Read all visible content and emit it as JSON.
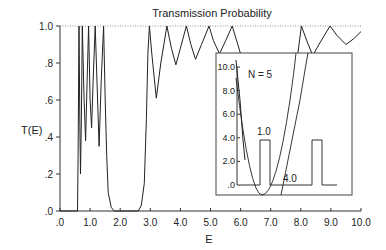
{
  "chart_data": [
    {
      "type": "line",
      "title": "Transmission Probability",
      "xlabel": "E",
      "ylabel": "T(E)",
      "xlim": [
        0,
        10
      ],
      "ylim": [
        0,
        1.0
      ],
      "x_ticks": [
        ".0",
        "1.0",
        "2.0",
        "3.0",
        "4.0",
        "5.0",
        "6.0",
        "7.0",
        "8.0",
        "9.0",
        "10.0"
      ],
      "y_ticks": [
        ".0",
        ".2",
        ".4",
        ".6",
        ".8",
        "1.0"
      ],
      "reference_line": {
        "y": 1.0,
        "style": "dotted"
      },
      "grid": false,
      "series": [
        {
          "name": "T(E)",
          "points": [
            [
              0.0,
              0.0
            ],
            [
              0.58,
              0.0
            ],
            [
              0.6,
              0.3
            ],
            [
              0.63,
              1.0
            ],
            [
              0.66,
              0.45
            ],
            [
              0.68,
              0.2
            ],
            [
              0.71,
              0.5
            ],
            [
              0.74,
              1.0
            ],
            [
              0.8,
              0.6
            ],
            [
              0.85,
              0.38
            ],
            [
              0.9,
              0.7
            ],
            [
              0.95,
              1.0
            ],
            [
              1.0,
              0.6
            ],
            [
              1.05,
              0.45
            ],
            [
              1.1,
              0.7
            ],
            [
              1.17,
              1.0
            ],
            [
              1.25,
              0.6
            ],
            [
              1.3,
              0.35
            ],
            [
              1.37,
              0.7
            ],
            [
              1.45,
              1.0
            ],
            [
              1.5,
              0.6
            ],
            [
              1.55,
              0.3
            ],
            [
              1.6,
              0.1
            ],
            [
              1.7,
              0.02
            ],
            [
              1.8,
              0.0
            ],
            [
              2.6,
              0.0
            ],
            [
              2.7,
              0.03
            ],
            [
              2.8,
              0.15
            ],
            [
              2.87,
              0.5
            ],
            [
              2.92,
              0.85
            ],
            [
              2.97,
              1.0
            ],
            [
              3.05,
              0.85
            ],
            [
              3.2,
              0.61
            ],
            [
              3.35,
              0.8
            ],
            [
              3.55,
              1.0
            ],
            [
              3.7,
              0.88
            ],
            [
              3.85,
              0.79
            ],
            [
              4.0,
              0.88
            ],
            [
              4.2,
              1.0
            ],
            [
              4.35,
              0.9
            ],
            [
              4.5,
              0.82
            ],
            [
              4.7,
              0.9
            ],
            [
              4.95,
              1.0
            ],
            [
              5.1,
              0.92
            ],
            [
              5.3,
              0.85
            ],
            [
              5.5,
              0.92
            ],
            [
              5.72,
              1.0
            ],
            [
              5.85,
              0.93
            ],
            [
              6.0,
              0.85
            ],
            [
              7.9,
              0.85
            ],
            [
              8.02,
              1.0
            ],
            [
              8.2,
              0.92
            ],
            [
              8.4,
              0.84
            ],
            [
              8.6,
              0.9
            ],
            [
              8.97,
              1.0
            ],
            [
              9.2,
              0.95
            ],
            [
              9.5,
              0.9
            ],
            [
              9.75,
              0.93
            ],
            [
              10.0,
              0.97
            ]
          ]
        }
      ],
      "notes": "Transmission resonances below barrier height; zero gap approx 1.8 < E < 2.6"
    },
    {
      "type": "line",
      "title": "Inset: potential profile",
      "annotation": "N = 5",
      "y_ticks": [
        ".0",
        "2.0",
        "4.0",
        "6.0",
        "8.0",
        "10.0"
      ],
      "ylim": [
        0,
        10.0
      ],
      "barrier_width_label": "1.0",
      "barrier_separation_label": "4.0",
      "series": [
        {
          "name": "barriers",
          "description": "rectangular barriers of height ~3.8, width 1.0, separated by 4.0"
        },
        {
          "name": "parabolic well",
          "description": "parabola with minimum slightly below 0 near first barrier"
        }
      ]
    }
  ],
  "labels": {
    "title": "Transmission Probability",
    "xlabel": "E",
    "ylabel": "T(E)",
    "x_ticks": [
      ".0",
      "1.0",
      "2.0",
      "3.0",
      "4.0",
      "5.0",
      "6.0",
      "7.0",
      "8.0",
      "9.0",
      "10.0"
    ],
    "y_ticks": [
      ".0",
      ".2",
      ".4",
      ".6",
      ".8",
      "1.0"
    ],
    "inset": {
      "annotation": "N = 5",
      "y_ticks": [
        ".0",
        "2.0",
        "4.0",
        "6.0",
        "8.0",
        "10.0"
      ],
      "width_label": "1.0",
      "sep_label": "4.0"
    }
  },
  "colors": {
    "line": "#222222",
    "axis": "#333333",
    "dotted": "#777777",
    "inset_border": "#444444"
  }
}
